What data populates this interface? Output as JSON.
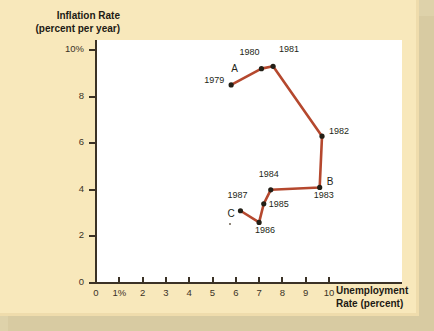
{
  "figure": {
    "background_color": "#f8e8bb",
    "plot_background_color": "#ffffff",
    "line_color": "#b5482e",
    "marker_color": "#231f16",
    "axis_color": "#3b3226",
    "shadow_color": "#d8cba2"
  },
  "axes": {
    "y_title_line1": "Inflation Rate",
    "y_title_line2": "(percent per year)",
    "x_title_line1": "Unemployment",
    "x_title_line2": "Rate (percent)",
    "y_ticks": [
      "10%",
      "8",
      "6",
      "4",
      "2",
      "0"
    ],
    "x_ticks": [
      "0",
      "1%",
      "2",
      "3",
      "4",
      "5",
      "6",
      "7",
      "8",
      "9",
      "10"
    ]
  },
  "chart_data": {
    "type": "line",
    "title": "",
    "xlabel": "Unemployment Rate (percent)",
    "ylabel": "Inflation Rate (percent per year)",
    "xlim": [
      0,
      10.8
    ],
    "ylim": [
      0,
      10.8
    ],
    "xticks": [
      0,
      1,
      2,
      3,
      4,
      5,
      6,
      7,
      8,
      9,
      10
    ],
    "yticks": [
      0,
      2,
      4,
      6,
      8,
      10
    ],
    "xticklabels": [
      "0",
      "1%",
      "2",
      "3",
      "4",
      "5",
      "6",
      "7",
      "8",
      "9",
      "10"
    ],
    "yticklabels": [
      "0",
      "2",
      "4",
      "6",
      "8",
      "10%"
    ],
    "grid": false,
    "legend": false,
    "series": [
      {
        "name": "Phillips curve path 1979-1987",
        "points": [
          {
            "label": "1979",
            "letter": "A",
            "x": 5.8,
            "y": 8.5
          },
          {
            "label": "1980",
            "letter": "",
            "x": 7.1,
            "y": 9.2
          },
          {
            "label": "1981",
            "letter": "",
            "x": 7.6,
            "y": 9.3
          },
          {
            "label": "1982",
            "letter": "",
            "x": 9.7,
            "y": 6.3
          },
          {
            "label": "1983",
            "letter": "B",
            "x": 9.6,
            "y": 4.1
          },
          {
            "label": "1984",
            "letter": "",
            "x": 7.5,
            "y": 4.0
          },
          {
            "label": "1985",
            "letter": "",
            "x": 7.2,
            "y": 3.4
          },
          {
            "label": "1986",
            "letter": "",
            "x": 7.0,
            "y": 2.6
          },
          {
            "label": "1987",
            "letter": "C",
            "x": 6.2,
            "y": 3.1
          }
        ]
      }
    ]
  }
}
